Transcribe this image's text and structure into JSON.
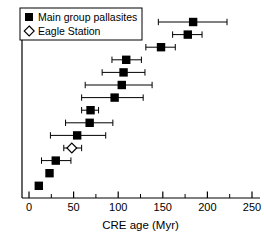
{
  "chart_data": {
    "type": "scatter",
    "title": "",
    "xlabel": "CRE age (Myr)",
    "ylabel": "",
    "xlim": [
      0,
      250
    ],
    "xticks": [
      0,
      50,
      100,
      150,
      200,
      250
    ],
    "xtick_labels": [
      "0",
      "50",
      "100",
      "150",
      "200",
      "250"
    ],
    "xminor_ticks": [
      25,
      75,
      125,
      175,
      225
    ],
    "grid": false,
    "legend_position": "top-left",
    "orientation": "horizontal-errorbar",
    "series": [
      {
        "name": "Main group pallasites",
        "marker": "filled-square",
        "color": "#000000",
        "points": [
          {
            "row": 1,
            "x": 184,
            "xerr_low": 145,
            "xerr_high": 222
          },
          {
            "row": 2,
            "x": 178,
            "xerr_low": 161,
            "xerr_high": 194
          },
          {
            "row": 3,
            "x": 148,
            "xerr_low": 131,
            "xerr_high": 164
          },
          {
            "row": 4,
            "x": 109,
            "xerr_low": 93,
            "xerr_high": 126
          },
          {
            "row": 5,
            "x": 106,
            "xerr_low": 82,
            "xerr_high": 130
          },
          {
            "row": 6,
            "x": 104,
            "xerr_low": 63,
            "xerr_high": 138
          },
          {
            "row": 7,
            "x": 96,
            "xerr_low": 59,
            "xerr_high": 128
          },
          {
            "row": 8,
            "x": 69,
            "xerr_low": 59,
            "xerr_high": 78
          },
          {
            "row": 9,
            "x": 68,
            "xerr_low": 41,
            "xerr_high": 94
          },
          {
            "row": 10,
            "x": 54,
            "xerr_low": 24,
            "xerr_high": 86
          },
          {
            "row": 12,
            "x": 30,
            "xerr_low": 14,
            "xerr_high": 47
          },
          {
            "row": 13,
            "x": 23,
            "xerr_low": null,
            "xerr_high": null
          },
          {
            "row": 14,
            "x": 11,
            "xerr_low": null,
            "xerr_high": null
          }
        ]
      },
      {
        "name": "Eagle Station",
        "marker": "open-diamond",
        "color": "#000000",
        "points": [
          {
            "row": 11,
            "x": 48,
            "xerr_low": 39,
            "xerr_high": 59
          }
        ]
      }
    ]
  },
  "legend": {
    "entries": [
      {
        "label": "Main group pallasites",
        "marker": "filled-square"
      },
      {
        "label": "Eagle Station",
        "marker": "open-diamond"
      }
    ]
  },
  "axis": {
    "x_label": "CRE age (Myr)",
    "tick_labels": [
      "0",
      "50",
      "100",
      "150",
      "200",
      "250"
    ]
  }
}
